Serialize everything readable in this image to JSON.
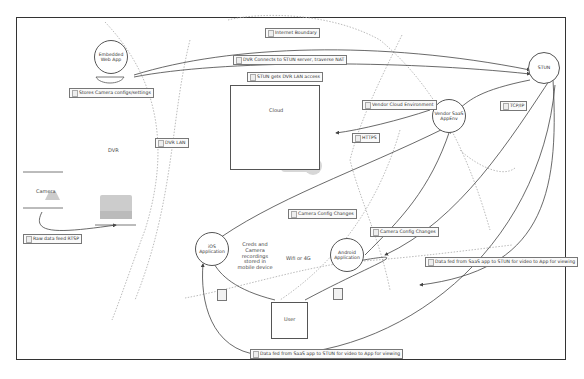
{
  "diagram": {
    "type": "network-architecture",
    "zones": {
      "dvr": "DVR",
      "cloud": "Cloud",
      "wifi": "Wifi or 4G"
    },
    "nodes": {
      "embedded_web_app": "Embedded Web App",
      "stun": "STUN",
      "vendor_saas": "Vendor SaaS AppEnv",
      "camera": "Camera",
      "ios_app": "iOS Application",
      "android_app": "Android Application",
      "user": "User"
    },
    "notes": {
      "creds": "Creds and Camera recordings stored in mobile device"
    },
    "labels": {
      "internet_boundary": "Internet Boundary",
      "dvr_connects": "DVR Connects to STUN server, traverse NAT",
      "stun_gets_dvr": "STUN gets DVR LAN access",
      "stores_camera": "Stores Camera configs/settings",
      "dvr_lan": "DVR LAN",
      "vendor_cloud": "Vendor Cloud Environment",
      "https": "HTTPS",
      "tcp_ip": "TCP/IP",
      "camera_config_1": "Camera Config Changes",
      "camera_config_2": "Camera Config Changes",
      "data_feed_right": "Data fed from SaaS app to STUN for video to App for viewing",
      "data_feed_bottom": "Data fed from SaaS app to STUN for video to App for viewing",
      "raw_feed": "Raw data feed RTSP"
    }
  }
}
